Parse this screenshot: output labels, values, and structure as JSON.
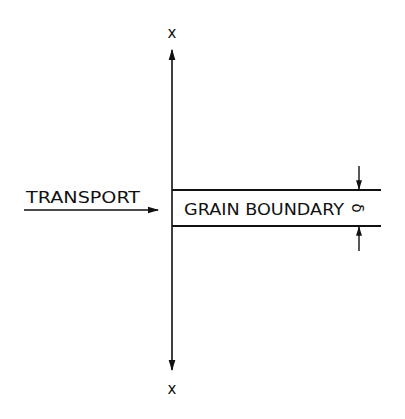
{
  "diagram": {
    "axis_label_top": "x",
    "axis_label_bottom": "x",
    "transport_label": "TRANSPORT",
    "boundary_label": "GRAIN BOUNDARY",
    "thickness_symbol": "δ",
    "line_color": "#111111",
    "background": "#ffffff"
  }
}
